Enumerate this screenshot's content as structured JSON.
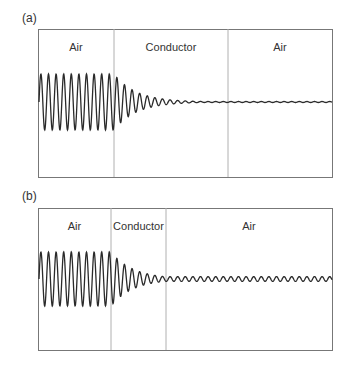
{
  "panels": [
    {
      "id": "a",
      "label": "(a)",
      "regions": [
        {
          "label": "Air"
        },
        {
          "label": "Conductor"
        },
        {
          "label": "Air"
        }
      ],
      "description": "Wave in air enters conductor, decays exponentially, negligible transmission into second air region"
    },
    {
      "id": "b",
      "label": "(b)",
      "regions": [
        {
          "label": "Air"
        },
        {
          "label": "Conductor"
        },
        {
          "label": "Air"
        }
      ],
      "description": "Thin conductor: wave decays partially, small-amplitude wave transmitted into second air region"
    }
  ],
  "colors": {
    "border": "#777777",
    "divider": "#aaaaaa",
    "wave": "#2a2a2a",
    "text": "#333333"
  }
}
